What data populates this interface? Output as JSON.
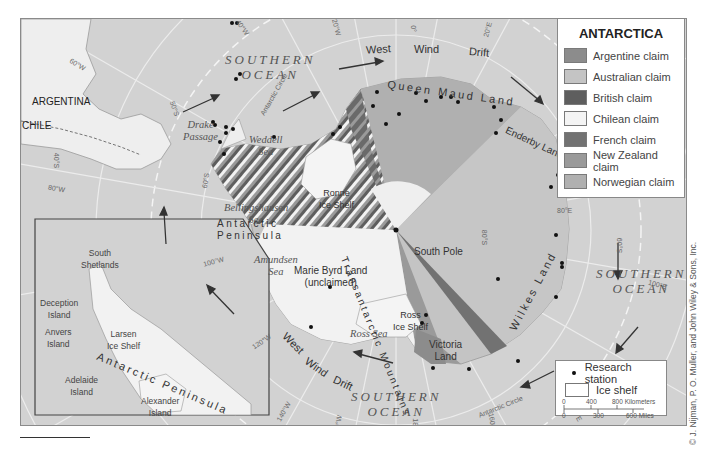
{
  "map": {
    "title": "ANTARCTICA",
    "legend": {
      "claims": [
        {
          "label": "Argentine claim",
          "color": "#8c8c8c"
        },
        {
          "label": "Australian claim",
          "color": "#c4c4c4"
        },
        {
          "label": "British claim",
          "color": "#5e5e5e"
        },
        {
          "label": "Chilean claim",
          "color": "#f4f4f4"
        },
        {
          "label": "French claim",
          "color": "#727272"
        },
        {
          "label": "New Zealand claim",
          "color": "#9a9a9a"
        },
        {
          "label": "Norwegian claim",
          "color": "#b0b0b0"
        }
      ],
      "research_station": "Research station",
      "ice_shelf": "Ice shelf",
      "scale": {
        "km_ticks": [
          "0",
          "400",
          "800 Kilometers"
        ],
        "mi_ticks": [
          "0",
          "300",
          "600 Miles"
        ]
      }
    },
    "oceans": {
      "southern_top": "SOUTHERN\nOCEAN",
      "southern_right": "SOUTHERN\nOCEAN",
      "southern_bottom": "SOUTHERN\nOCEAN"
    },
    "seas": {
      "weddell": "Weddell\nSea",
      "bellingshausen": "Bellingshausen\nSea",
      "amundsen": "Amundsen\nSea",
      "ross": "Ross Sea",
      "drake": "Drake\nPassage",
      "inset_weddell": "Weddell\nSea"
    },
    "places": {
      "queen_maud": "Queen Maud Land",
      "enderby": "Enderby Land",
      "wilkes": "Wilkes Land",
      "victoria": "Victoria\nLand",
      "marie_byrd": "Marie Byrd Land\n(unclaimed)",
      "ronne": "Ronne\nIce Shelf",
      "ross_shelf": "Ross\nIce Shelf",
      "south_pole": "South Pole",
      "antarctic_peninsula": "Antarctic\nPeninsula",
      "transantarctic": "Transantarctic Mountains",
      "argentina": "ARGENTINA",
      "chile": "CHILE"
    },
    "wind": {
      "top": [
        "West",
        "Wind",
        "Drift"
      ],
      "bottom": [
        "West",
        "Wind",
        "Drift"
      ]
    },
    "circle_label": "Antarctic Circle",
    "degrees": {
      "w60": "60°W",
      "w40top": "40°W",
      "w20": "20°W",
      "e0": "0°",
      "e20": "20°E",
      "e40": "40°E",
      "e60": "60°E",
      "e80": "80°E",
      "s80": "80°S",
      "s60": "60°S",
      "e100": "100°E",
      "e120": "120°E",
      "e140": "140°E",
      "e160": "160°E",
      "e180": "180°",
      "w160": "160°W",
      "w140": "140°W",
      "w120": "120°W",
      "w100": "100°W",
      "w80": "80°W",
      "s40": "40°S",
      "s60w": "60°S",
      "s50": "50°S"
    },
    "inset": {
      "south_shetlands": "South\nShetlands",
      "deception": "Deception\nIsland",
      "anvers": "Anvers\nIsland",
      "larsen": "Larsen\nIce Shelf",
      "peninsula": "Antarctic Peninsula",
      "adelaide": "Adelaide\nIsland",
      "alexander": "Alexander\nIsland"
    },
    "credit": "© J. Nijman, P. O. Muller, and John Wiley & Sons, Inc."
  }
}
